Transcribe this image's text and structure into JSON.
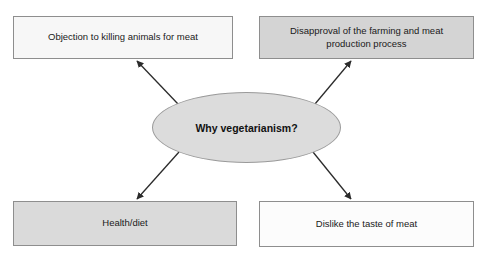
{
  "diagram": {
    "background_color": "#ffffff",
    "center": {
      "label": "Why vegetarianism?",
      "shape": "ellipse",
      "fill_color": "#dcdcdc",
      "border_color": "#9a9a9a"
    },
    "nodes": [
      {
        "id": "objection",
        "label": "Objection to killing animals for meat",
        "position": "top-left",
        "fill_color": "#f7f7f7",
        "border_color": "#8e8e8e"
      },
      {
        "id": "disapproval",
        "label": "Disapproval of the farming and meat\nproduction process",
        "position": "top-right",
        "fill_color": "#d4d4d4",
        "border_color": "#8e8e8e"
      },
      {
        "id": "health",
        "label": "Health/diet",
        "position": "bottom-left",
        "fill_color": "#dadada",
        "border_color": "#8e8e8e"
      },
      {
        "id": "dislike",
        "label": "Dislike the taste of meat",
        "position": "bottom-right",
        "fill_color": "#fcfcfc",
        "border_color": "#8e8e8e"
      }
    ],
    "arrows": [
      {
        "id": "center-to-objection",
        "from": "center",
        "to": "objection",
        "color": "#2b2b2b"
      },
      {
        "id": "center-to-disapproval",
        "from": "center",
        "to": "disapproval",
        "color": "#2b2b2b"
      },
      {
        "id": "center-to-health",
        "from": "center",
        "to": "health",
        "color": "#2b2b2b"
      },
      {
        "id": "center-to-dislike",
        "from": "center",
        "to": "dislike",
        "color": "#2b2b2b"
      }
    ]
  }
}
